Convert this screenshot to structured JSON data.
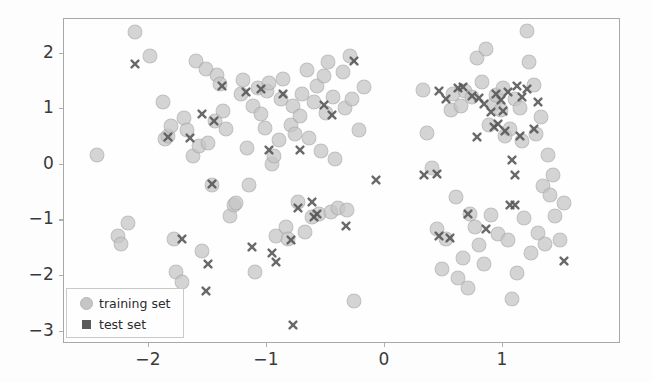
{
  "figure": {
    "background_color": "#fdfdfd",
    "axes_color": "#a8a8a8",
    "tick_text_color": "#3a3a3a"
  },
  "legend": {
    "entries": [
      {
        "label": "training set",
        "marker": "circle",
        "color": "#c6c6c6"
      },
      {
        "label": "test set",
        "marker": "x",
        "color": "#5a5a5a"
      }
    ]
  },
  "chart_data": {
    "type": "scatter",
    "title": "",
    "xlabel": "",
    "ylabel": "",
    "xlim": [
      -2.72,
      2.0
    ],
    "ylim": [
      -3.22,
      2.62
    ],
    "xticks": [
      -2,
      -1,
      0,
      1
    ],
    "xticklabels": [
      "−2",
      "−1",
      "0",
      "1"
    ],
    "yticks": [
      2,
      1,
      0,
      -1,
      -2,
      -3
    ],
    "yticklabels": [
      "2",
      "1",
      "0",
      "−1",
      "−2",
      "−3"
    ],
    "grid": false,
    "legend_position": "lower left",
    "series": [
      {
        "name": "training set",
        "marker": "circle",
        "color": "#c6c6c6",
        "opacity": 0.75,
        "size": 13,
        "points": [
          [
            -2.44,
            0.17
          ],
          [
            -2.26,
            -1.28
          ],
          [
            -2.24,
            -1.42
          ],
          [
            -2.18,
            -1.05
          ],
          [
            -2.12,
            2.38
          ],
          [
            -1.99,
            1.95
          ],
          [
            -1.88,
            1.12
          ],
          [
            -1.86,
            0.47
          ],
          [
            -1.84,
            0.52
          ],
          [
            -1.81,
            0.7
          ],
          [
            -1.79,
            -1.33
          ],
          [
            -1.77,
            -1.93
          ],
          [
            -1.72,
            -2.11
          ],
          [
            -1.7,
            0.84
          ],
          [
            -1.68,
            0.62
          ],
          [
            -1.63,
            0.16
          ],
          [
            -1.6,
            1.87
          ],
          [
            -1.58,
            0.34
          ],
          [
            -1.55,
            -1.55
          ],
          [
            -1.52,
            1.72
          ],
          [
            -1.5,
            0.4
          ],
          [
            -1.47,
            -0.36
          ],
          [
            -1.44,
            0.78
          ],
          [
            -1.42,
            1.62
          ],
          [
            -1.4,
            1.45
          ],
          [
            -1.37,
            0.96
          ],
          [
            -1.35,
            0.64
          ],
          [
            -1.31,
            -0.92
          ],
          [
            -1.28,
            -0.73
          ],
          [
            -1.26,
            -0.68
          ],
          [
            -1.22,
            1.27
          ],
          [
            -1.2,
            1.52
          ],
          [
            -1.17,
            0.3
          ],
          [
            -1.15,
            -0.36
          ],
          [
            -1.12,
            1.06
          ],
          [
            -1.1,
            -1.93
          ],
          [
            -1.08,
            1.38
          ],
          [
            -1.05,
            0.92
          ],
          [
            -1.02,
            0.67
          ],
          [
            -1.0,
            1.33
          ],
          [
            -0.98,
            1.47
          ],
          [
            -0.96,
            0.02
          ],
          [
            -0.94,
            0.16
          ],
          [
            -0.92,
            -1.28
          ],
          [
            -0.9,
            0.44
          ],
          [
            -0.88,
            1.18
          ],
          [
            -0.86,
            1.55
          ],
          [
            -0.84,
            -1.12
          ],
          [
            -0.82,
            -1.34
          ],
          [
            -0.8,
            0.72
          ],
          [
            -0.78,
            1.05
          ],
          [
            -0.76,
            0.56
          ],
          [
            -0.74,
            -0.67
          ],
          [
            -0.72,
            0.88
          ],
          [
            -0.7,
            1.28
          ],
          [
            -0.68,
            -1.21
          ],
          [
            -0.66,
            1.7
          ],
          [
            -0.64,
            0.48
          ],
          [
            -0.62,
            -0.94
          ],
          [
            -0.6,
            1.13
          ],
          [
            -0.58,
            1.42
          ],
          [
            -0.56,
            -0.88
          ],
          [
            -0.54,
            0.24
          ],
          [
            -0.52,
            1.6
          ],
          [
            -0.5,
            0.93
          ],
          [
            -0.48,
            1.85
          ],
          [
            -0.46,
            -0.85
          ],
          [
            -0.44,
            1.22
          ],
          [
            -0.42,
            0.1
          ],
          [
            -0.4,
            -0.77
          ],
          [
            -0.36,
            1.66
          ],
          [
            -0.34,
            1.02
          ],
          [
            -0.32,
            -0.82
          ],
          [
            -0.3,
            1.95
          ],
          [
            -0.28,
            1.18
          ],
          [
            -0.26,
            -2.45
          ],
          [
            -0.22,
            0.62
          ],
          [
            -0.18,
            1.4
          ],
          [
            0.32,
            1.35
          ],
          [
            0.36,
            0.58
          ],
          [
            0.4,
            -0.06
          ],
          [
            0.44,
            -1.16
          ],
          [
            0.48,
            -1.88
          ],
          [
            0.52,
            -1.33
          ],
          [
            0.56,
            0.98
          ],
          [
            0.58,
            1.28
          ],
          [
            0.6,
            -0.57
          ],
          [
            0.62,
            -2.03
          ],
          [
            0.64,
            1.05
          ],
          [
            0.66,
            -1.68
          ],
          [
            0.68,
            1.32
          ],
          [
            0.7,
            -2.22
          ],
          [
            0.72,
            -0.88
          ],
          [
            0.74,
            1.22
          ],
          [
            0.76,
            -1.12
          ],
          [
            0.78,
            1.92
          ],
          [
            0.8,
            -1.45
          ],
          [
            0.82,
            1.48
          ],
          [
            0.84,
            -1.78
          ],
          [
            0.86,
            2.08
          ],
          [
            0.88,
            0.72
          ],
          [
            0.9,
            -0.9
          ],
          [
            0.92,
            1.1
          ],
          [
            0.94,
            1.26
          ],
          [
            0.96,
            -1.25
          ],
          [
            0.98,
            0.98
          ],
          [
            1.0,
            1.38
          ],
          [
            1.02,
            0.52
          ],
          [
            1.04,
            -1.35
          ],
          [
            1.06,
            0.64
          ],
          [
            1.08,
            -2.42
          ],
          [
            1.1,
            1.18
          ],
          [
            1.12,
            -1.95
          ],
          [
            1.14,
            1.02
          ],
          [
            1.16,
            0.43
          ],
          [
            1.18,
            -0.96
          ],
          [
            1.2,
            2.4
          ],
          [
            1.22,
            1.85
          ],
          [
            1.24,
            -1.58
          ],
          [
            1.26,
            1.44
          ],
          [
            1.28,
            0.55
          ],
          [
            1.3,
            -1.22
          ],
          [
            1.32,
            0.86
          ],
          [
            1.34,
            -0.38
          ],
          [
            1.36,
            -1.42
          ],
          [
            1.38,
            0.18
          ],
          [
            1.4,
            -0.55
          ],
          [
            1.42,
            -0.18
          ],
          [
            1.44,
            -0.92
          ],
          [
            1.48,
            -1.35
          ],
          [
            1.52,
            -0.68
          ]
        ]
      },
      {
        "name": "test set",
        "marker": "x",
        "color": "#5a5a5a",
        "opacity": 0.9,
        "size": 10,
        "points": [
          [
            -2.12,
            1.82
          ],
          [
            -1.84,
            0.5
          ],
          [
            -1.72,
            -1.33
          ],
          [
            -1.65,
            0.48
          ],
          [
            -1.55,
            0.92
          ],
          [
            -1.52,
            -2.27
          ],
          [
            -1.5,
            -1.78
          ],
          [
            -1.47,
            -0.35
          ],
          [
            -1.45,
            0.79
          ],
          [
            -1.38,
            1.42
          ],
          [
            -1.18,
            1.31
          ],
          [
            -1.13,
            -1.48
          ],
          [
            -1.05,
            1.36
          ],
          [
            -0.98,
            0.26
          ],
          [
            -0.96,
            -1.58
          ],
          [
            -0.92,
            -1.74
          ],
          [
            -0.86,
            1.28
          ],
          [
            -0.8,
            -1.36
          ],
          [
            -0.78,
            -2.88
          ],
          [
            -0.74,
            -0.78
          ],
          [
            -0.72,
            0.27
          ],
          [
            -0.62,
            -0.67
          ],
          [
            -0.6,
            -0.93
          ],
          [
            -0.58,
            -0.88
          ],
          [
            -0.52,
            1.08
          ],
          [
            -0.45,
            0.9
          ],
          [
            -0.33,
            -1.1
          ],
          [
            -0.26,
            1.86
          ],
          [
            -0.08,
            -0.27
          ],
          [
            0.33,
            -0.18
          ],
          [
            0.44,
            -0.17
          ],
          [
            0.46,
            1.33
          ],
          [
            0.55,
            -1.32
          ],
          [
            0.62,
            1.38
          ],
          [
            0.66,
            1.4
          ],
          [
            0.7,
            -0.88
          ],
          [
            0.74,
            1.24
          ],
          [
            0.78,
            0.5
          ],
          [
            0.8,
            1.2
          ],
          [
            0.84,
            1.09
          ],
          [
            0.86,
            -1.15
          ],
          [
            0.9,
            0.94
          ],
          [
            0.92,
            0.68
          ],
          [
            0.94,
            1.28
          ],
          [
            0.96,
            0.73
          ],
          [
            0.98,
            1.16
          ],
          [
            1.0,
            0.96
          ],
          [
            1.02,
            0.6
          ],
          [
            1.04,
            1.3
          ],
          [
            1.06,
            -0.73
          ],
          [
            1.08,
            0.08
          ],
          [
            1.1,
            -0.19
          ],
          [
            1.12,
            1.42
          ],
          [
            1.14,
            0.52
          ],
          [
            1.16,
            1.22
          ],
          [
            1.2,
            1.36
          ],
          [
            1.26,
            0.64
          ],
          [
            1.3,
            1.12
          ],
          [
            1.52,
            -1.73
          ],
          [
            1.1,
            -0.72
          ],
          [
            0.46,
            -1.28
          ],
          [
            0.52,
            1.18
          ]
        ]
      }
    ]
  }
}
